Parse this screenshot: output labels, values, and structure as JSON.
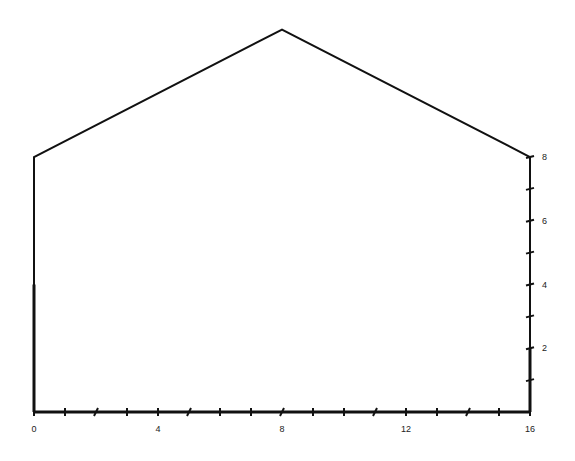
{
  "diagram": {
    "type": "house-outline-on-grid",
    "shape_points": [
      [
        0,
        0
      ],
      [
        0,
        8
      ],
      [
        8,
        12
      ],
      [
        16,
        8
      ],
      [
        16,
        0
      ],
      [
        0,
        0
      ]
    ],
    "stroke_color": "#111111",
    "background": "#ffffff"
  },
  "x_axis": {
    "min": 0,
    "max": 16,
    "ticks": [
      0,
      1,
      2,
      3,
      4,
      5,
      6,
      7,
      8,
      9,
      10,
      11,
      12,
      13,
      14,
      15,
      16
    ],
    "labels": [
      {
        "value": 0,
        "text": "0"
      },
      {
        "value": 4,
        "text": "4"
      },
      {
        "value": 8,
        "text": "8"
      },
      {
        "value": 12,
        "text": "12"
      },
      {
        "value": 16,
        "text": "16"
      }
    ]
  },
  "y_axis_right": {
    "min": 0,
    "max": 8,
    "ticks": [
      1,
      2,
      3,
      4,
      5,
      6,
      7,
      8
    ],
    "labels": [
      {
        "value": 2,
        "text": "2"
      },
      {
        "value": 4,
        "text": "4"
      },
      {
        "value": 6,
        "text": "6"
      },
      {
        "value": 8,
        "text": "8"
      }
    ]
  }
}
